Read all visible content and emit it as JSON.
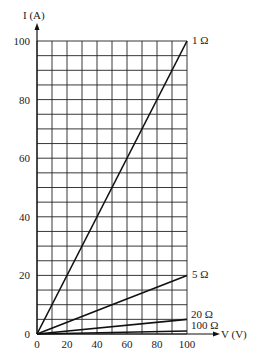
{
  "chart_data": {
    "type": "line",
    "title": "",
    "xlabel": "V (V)",
    "ylabel": "I (A)",
    "xlim": [
      0,
      100
    ],
    "ylim": [
      0,
      100
    ],
    "grid": true,
    "x_ticks": [
      0,
      20,
      40,
      60,
      80,
      100
    ],
    "y_ticks": [
      0,
      20,
      40,
      60,
      80,
      100
    ],
    "x_grid_step": 10,
    "y_grid_step": 5,
    "legend_position": "inline labels at right end of lines",
    "series": [
      {
        "name": "1 Ω",
        "x": [
          0,
          100
        ],
        "y": [
          0,
          100
        ]
      },
      {
        "name": "5 Ω",
        "x": [
          0,
          100
        ],
        "y": [
          0,
          20
        ]
      },
      {
        "name": "20 Ω",
        "x": [
          0,
          100
        ],
        "y": [
          0,
          5
        ]
      },
      {
        "name": "100 Ω",
        "x": [
          0,
          100
        ],
        "y": [
          0,
          1
        ]
      }
    ]
  },
  "axes": {
    "x_label": "V (V)",
    "y_label": "I (A)"
  },
  "colors": {
    "line": "#111111",
    "grid": "#222222",
    "background": "#ffffff"
  }
}
